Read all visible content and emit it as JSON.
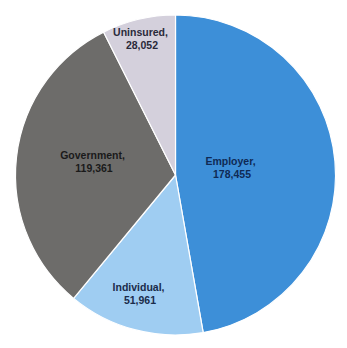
{
  "chart_data": {
    "type": "pie",
    "title": "",
    "categories": [
      "Employer",
      "Individual",
      "Government",
      "Uninsured"
    ],
    "values": [
      178455,
      51961,
      119361,
      28052
    ],
    "labels": [
      "178,455",
      "51,961",
      "119,361",
      "28,052"
    ],
    "colors": [
      "#3d8fd8",
      "#9fcdf2",
      "#6d6c6a",
      "#d4d0dc"
    ],
    "label_colors": [
      "#0f2a55",
      "#1a2b4a",
      "#1a1a1a",
      "#2a2a3a"
    ],
    "start_angle_deg": 0,
    "direction": "clockwise",
    "legend": "none",
    "data_labels": "category, value"
  },
  "slices": [
    {
      "name": "Employer",
      "value_text": "178,455",
      "label_x": 232,
      "label_y": 165
    },
    {
      "name": "Individual",
      "value_text": "51,961",
      "label_x": 140,
      "label_y": 291
    },
    {
      "name": "Government",
      "value_text": "119,361",
      "label_x": 94,
      "label_y": 159
    },
    {
      "name": "Uninsured",
      "value_text": "28,052",
      "label_x": 142,
      "label_y": 36
    }
  ]
}
